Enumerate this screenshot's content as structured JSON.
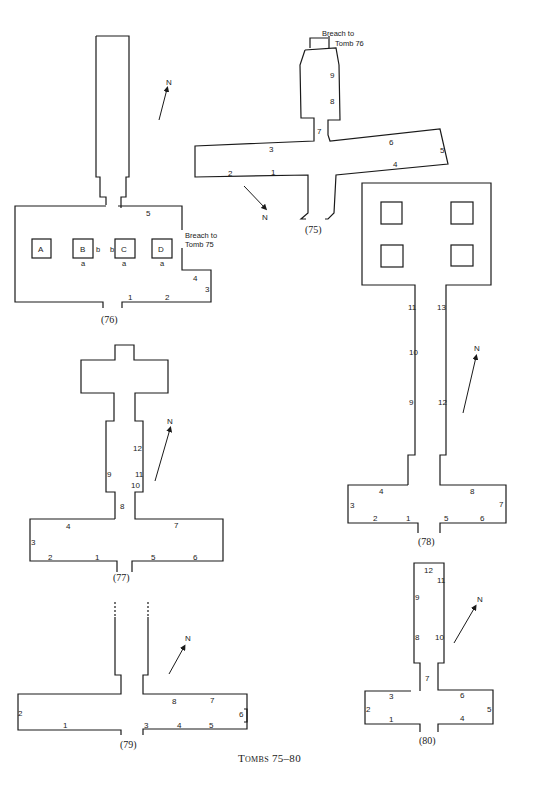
{
  "figure": {
    "caption": "Tombs 75–80",
    "compass_label": "N"
  },
  "tombs": {
    "t75": {
      "id": "(75)",
      "labels": [
        "1",
        "2",
        "3",
        "4",
        "5",
        "6",
        "7",
        "8",
        "9"
      ],
      "note_line1": "Breach to",
      "note_line2": "Tomb 76"
    },
    "t76": {
      "id": "(76)",
      "labels": [
        "1",
        "2",
        "3",
        "4",
        "5"
      ],
      "pillars": [
        "A",
        "B",
        "C",
        "D"
      ],
      "pillar_marks": {
        "a": "a",
        "b": "b"
      },
      "note_line1": "Breach to",
      "note_line2": "Tomb 75"
    },
    "t77": {
      "id": "(77)",
      "labels": [
        "1",
        "2",
        "3",
        "4",
        "5",
        "6",
        "7",
        "8",
        "9",
        "10",
        "11",
        "12"
      ]
    },
    "t78": {
      "id": "(78)",
      "labels": [
        "1",
        "2",
        "3",
        "4",
        "5",
        "6",
        "7",
        "8",
        "9",
        "10",
        "11",
        "12",
        "13"
      ]
    },
    "t79": {
      "id": "(79)",
      "labels": [
        "1",
        "2",
        "3",
        "4",
        "5",
        "6",
        "7",
        "8"
      ]
    },
    "t80": {
      "id": "(80)",
      "labels": [
        "1",
        "2",
        "3",
        "4",
        "5",
        "6",
        "7",
        "8",
        "9",
        "10",
        "11",
        "12"
      ]
    }
  }
}
